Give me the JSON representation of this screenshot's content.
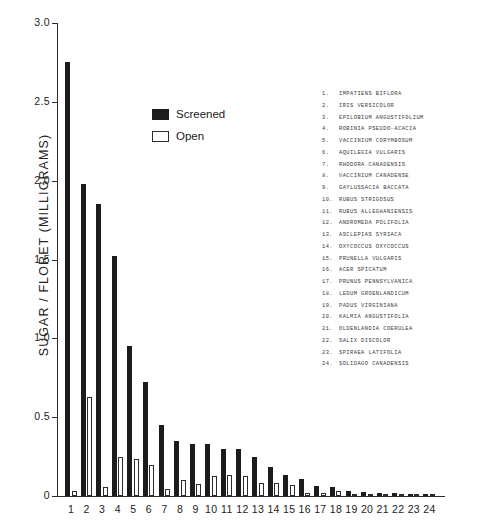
{
  "chart_data": {
    "type": "bar",
    "title": "",
    "subtitle": "",
    "xlabel": "",
    "ylabel": "SUGAR / FLORET (MILLIGRAMS)",
    "ylim": [
      0,
      3.0
    ],
    "ytick_labels": [
      "3.0",
      "2.5",
      "2.0",
      "1.5",
      "1.0",
      "0.5",
      "0"
    ],
    "ytick_values": [
      3.0,
      2.5,
      2.0,
      1.5,
      1.0,
      0.5,
      0
    ],
    "grid": false,
    "legend_position": "upper-center-left",
    "categories": [
      "1",
      "2",
      "3",
      "4",
      "5",
      "6",
      "7",
      "8",
      "9",
      "10",
      "11",
      "12",
      "13",
      "14",
      "15",
      "16",
      "17",
      "18",
      "19",
      "20",
      "21",
      "22",
      "23",
      "24"
    ],
    "series": [
      {
        "name": "Screened",
        "color": "#1c1c1c",
        "values": [
          2.75,
          1.98,
          1.85,
          1.52,
          0.95,
          0.72,
          0.45,
          0.35,
          0.33,
          0.33,
          0.3,
          0.3,
          0.245,
          0.185,
          0.135,
          0.105,
          0.065,
          0.055,
          0.03,
          0.028,
          0.022,
          0.018,
          0.012,
          0.01
        ]
      },
      {
        "name": "Open",
        "color": "#ffffff",
        "values": [
          0.03,
          0.625,
          0.06,
          0.245,
          0.235,
          0.195,
          0.045,
          0.1,
          0.075,
          0.125,
          0.135,
          0.13,
          0.085,
          0.08,
          0.07,
          0.022,
          0.018,
          0.03,
          0.014,
          0.01,
          0.01,
          0.008,
          0.006,
          0.006
        ]
      }
    ],
    "annotations": []
  },
  "legend": {
    "items": [
      {
        "label": "Screened",
        "swatch": "filled-black"
      },
      {
        "label": "Open",
        "swatch": "outlined-white"
      }
    ]
  },
  "species_key": {
    "entries": [
      {
        "num": "1.",
        "name": "IMPATIENS BIFLORA"
      },
      {
        "num": "2.",
        "name": "IRIS VERSICOLOR"
      },
      {
        "num": "3.",
        "name": "EPILOBIUM ANGUSTIFOLIUM"
      },
      {
        "num": "4.",
        "name": "ROBINIA PSEUDO-ACACIA"
      },
      {
        "num": "5.",
        "name": "VACCINIUM CORYMBOSUM"
      },
      {
        "num": "6.",
        "name": "AQUILEGIA VULGARIS"
      },
      {
        "num": "7.",
        "name": "RHODORA CANADENSIS"
      },
      {
        "num": "8.",
        "name": "VACCINIUM CANADENSE"
      },
      {
        "num": "9.",
        "name": "GAYLUSSACIA BACCATA"
      },
      {
        "num": "10.",
        "name": "RUBUS STRIGOSUS"
      },
      {
        "num": "11.",
        "name": "RUBUS ALLEGHANIENSIS"
      },
      {
        "num": "12.",
        "name": "ANDROMEDA POLIFOLIA"
      },
      {
        "num": "13.",
        "name": "ASCLEPIAS SYRIACA"
      },
      {
        "num": "14.",
        "name": "OXYCOCCUS OXYCOCCUS"
      },
      {
        "num": "15.",
        "name": "PRUNELLA VULGARIS"
      },
      {
        "num": "16.",
        "name": "ACER SPICATUM"
      },
      {
        "num": "17.",
        "name": "PRUNUS PENNSYLVANICA"
      },
      {
        "num": "18.",
        "name": "LEDUM GROENLANDICUM"
      },
      {
        "num": "19.",
        "name": "PADUS VIRGINIANA"
      },
      {
        "num": "20.",
        "name": "KALMIA ANGUSTIFOLIA"
      },
      {
        "num": "21.",
        "name": "OLDENLANDIA COERULEA"
      },
      {
        "num": "22.",
        "name": "SALIX DISCOLOR"
      },
      {
        "num": "23.",
        "name": "SPIRAEA LATIFOLIA"
      },
      {
        "num": "24.",
        "name": "SOLIDAGO CANADENSIS"
      }
    ]
  }
}
